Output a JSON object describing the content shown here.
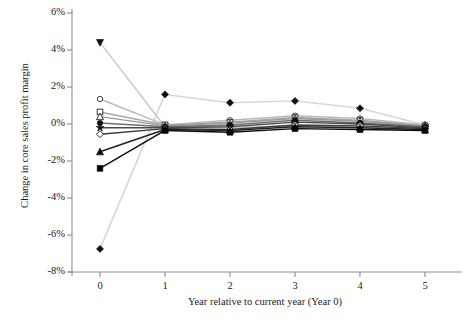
{
  "figure": {
    "cut_title_fragment": "",
    "axis": {
      "ylabel": "Change in core sales profit margin",
      "xlabel": "Year relative to current year (Year 0)",
      "yticklabels": [
        "6%",
        "4%",
        "2%",
        "0%",
        "-2%",
        "-4%",
        "-6%",
        "-8%"
      ],
      "xticklabels": [
        "0",
        "1",
        "2",
        "3",
        "4",
        "5"
      ]
    }
  },
  "chart_data": {
    "type": "line",
    "title": "",
    "subtitle": "",
    "xlabel": "Year relative to current year (Year 0)",
    "ylabel": "Change in core sales profit margin",
    "x": [
      0,
      1,
      2,
      3,
      4,
      5
    ],
    "xlim": [
      -0.35,
      5.35
    ],
    "ylim": [
      -8,
      6
    ],
    "ytick_values": [
      6,
      4,
      2,
      0,
      -2,
      -4,
      -6,
      -8
    ],
    "ytick_labels": [
      "6%",
      "4%",
      "2%",
      "0%",
      "-2%",
      "-4%",
      "-6%",
      "-8%"
    ],
    "xtick_values": [
      0,
      1,
      2,
      3,
      4,
      5
    ],
    "xtick_labels": [
      "0",
      "1",
      "2",
      "3",
      "4",
      "5"
    ],
    "grid": false,
    "legend": "none",
    "units": "percent",
    "series": [
      {
        "name": "decile-1-triangle-down",
        "marker": "triangle-down",
        "filled": true,
        "color": "#111111",
        "line_color": "#c9c9c9",
        "values": [
          4.4,
          -0.15,
          -0.2,
          -0.1,
          -0.15,
          -0.2
        ]
      },
      {
        "name": "decile-2-diamond-top",
        "marker": "diamond",
        "filled": true,
        "color": "#111111",
        "line_color": "#d6d6d6",
        "values": [
          -6.75,
          1.6,
          1.15,
          1.25,
          0.85,
          -0.05
        ]
      },
      {
        "name": "decile-3-circle-open",
        "marker": "circle-open",
        "filled": false,
        "color": "#3a3a3a",
        "line_color": "#b9b9b9",
        "values": [
          1.35,
          -0.05,
          0.2,
          0.45,
          0.3,
          -0.05
        ]
      },
      {
        "name": "decile-4-square-open",
        "marker": "square-open",
        "filled": false,
        "color": "#2f2f2f",
        "line_color": "#a8a8a8",
        "values": [
          0.65,
          -0.05,
          0.1,
          0.35,
          0.2,
          -0.1
        ]
      },
      {
        "name": "decile-5-triangle-open",
        "marker": "triangle-open",
        "filled": false,
        "color": "#2a2a2a",
        "line_color": "#9a9a9a",
        "values": [
          0.4,
          -0.1,
          0.05,
          0.3,
          0.15,
          -0.1
        ]
      },
      {
        "name": "decile-6-circle-filled",
        "marker": "circle",
        "filled": true,
        "color": "#101010",
        "line_color": "#6f6f6f",
        "values": [
          0.05,
          -0.15,
          -0.05,
          0.2,
          0.05,
          -0.15
        ]
      },
      {
        "name": "decile-7-star",
        "marker": "star",
        "filled": true,
        "color": "#101010",
        "line_color": "#4a4a4a",
        "values": [
          -0.2,
          -0.2,
          -0.15,
          0.1,
          0.0,
          -0.2
        ]
      },
      {
        "name": "decile-8-diamond-open",
        "marker": "diamond-open",
        "filled": false,
        "color": "#1a1a1a",
        "line_color": "#3a3a3a",
        "values": [
          -0.55,
          -0.25,
          -0.3,
          -0.05,
          -0.1,
          -0.25
        ]
      },
      {
        "name": "decile-9-triangle-up",
        "marker": "triangle-up",
        "filled": true,
        "color": "#0d0d0d",
        "line_color": "#222222",
        "values": [
          -1.5,
          -0.3,
          -0.35,
          -0.15,
          -0.2,
          -0.3
        ]
      },
      {
        "name": "decile-10-square-filled",
        "marker": "square",
        "filled": true,
        "color": "#050505",
        "line_color": "#0b0b0b",
        "values": [
          -2.4,
          -0.35,
          -0.45,
          -0.25,
          -0.3,
          -0.35
        ]
      }
    ]
  }
}
